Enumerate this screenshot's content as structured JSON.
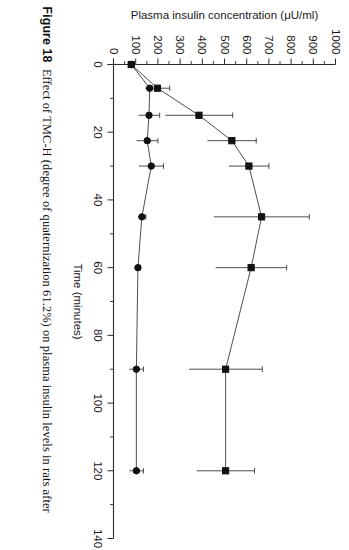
{
  "figure": {
    "label": "Figure 18",
    "caption": "Effect of TMC-H (degree of quaternization 61.2%) on plasma insulin levels in rats after",
    "orientation_degrees": 90
  },
  "axes": {
    "x_title": "Time (minutes)",
    "y_title": "Plasma insulin concentration (μU/ml)",
    "x_ticklabels": [
      "0",
      "20",
      "40",
      "60",
      "80",
      "100",
      "120",
      "140"
    ],
    "y_ticklabels": [
      "0",
      "100",
      "200",
      "300",
      "400",
      "500",
      "600",
      "700",
      "800",
      "900",
      "1000"
    ]
  },
  "chart_data": {
    "type": "line",
    "title": "Effect of TMC-H (degree of quaternization 61.2%) on plasma insulin levels in rats after",
    "xlabel": "Time (minutes)",
    "ylabel": "Plasma insulin concentration (μU/ml)",
    "xlim": [
      0,
      140
    ],
    "ylim": [
      0,
      1000
    ],
    "xticks": [
      0,
      20,
      40,
      60,
      80,
      100,
      120,
      140
    ],
    "yticks": [
      0,
      100,
      200,
      300,
      400,
      500,
      600,
      700,
      800,
      900,
      1000
    ],
    "xminor_step": 10,
    "grid": false,
    "legend": "none",
    "marker_colors": {
      "series1": "#111111",
      "series2": "#111111"
    },
    "series": [
      {
        "name": "TMC-H (degree of quaternization 61.2%)",
        "marker": "filled-square",
        "x": [
          0,
          7,
          15,
          22.5,
          30,
          45,
          60,
          90,
          120
        ],
        "values": [
          80,
          198,
          385,
          533,
          610,
          667,
          620,
          505,
          505
        ],
        "err_upper": [
          10,
          55,
          152,
          110,
          90,
          215,
          160,
          165,
          130
        ],
        "err_lower": [
          10,
          55,
          152,
          110,
          90,
          215,
          160,
          165,
          130
        ]
      },
      {
        "name": "Control",
        "marker": "filled-circle",
        "x": [
          0,
          7,
          15,
          22.5,
          30,
          45,
          60,
          90,
          120
        ],
        "values": [
          80,
          163,
          160,
          152,
          170,
          128,
          110,
          103,
          103
        ],
        "err_upper": [
          8,
          10,
          48,
          48,
          55,
          18,
          12,
          32,
          32
        ],
        "err_lower": [
          8,
          10,
          48,
          48,
          55,
          18,
          12,
          32,
          32
        ]
      }
    ]
  }
}
